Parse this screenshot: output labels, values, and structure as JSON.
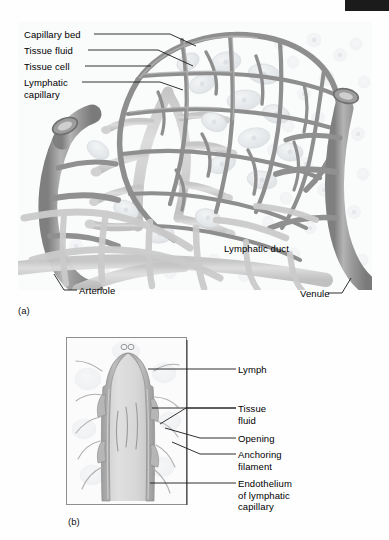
{
  "figure": {
    "panel_a": {
      "letter": "(a)",
      "labels": {
        "capillary_bed": "Capillary bed",
        "tissue_fluid": "Tissue fluid",
        "tissue_cell": "Tissue cell",
        "lymphatic_capillary": "Lymphatic\ncapillary",
        "lymphatic_duct": "Lymphatic duct",
        "arteriole": "Arteriole",
        "venule": "Venule"
      }
    },
    "panel_b": {
      "letter": "(b)",
      "labels": {
        "lymph": "Lymph",
        "tissue_fluid": "Tissue\nfluid",
        "opening": "Opening",
        "anchoring_filament": "Anchoring\nfilament",
        "endothelium": "Endothelium\nof lymphatic\ncapillary"
      }
    }
  },
  "colors": {
    "page_background": "#fefefe",
    "scan_bar": "#1b1b1b",
    "vessel_dark": "#8c8c8c",
    "vessel_mid": "#a6a6a6",
    "vessel_light": "#c2c2c2",
    "lymphatic_light": "#d4d4d4",
    "tissue_cell": "#e6e8ea",
    "background_tissue": "#f5f6f7",
    "label_text": "#000000",
    "leader_line": "#1a1a1a",
    "panel_border": "#8f8f8f"
  },
  "icons": {
    "scan_bar": "scan-artifact-bar"
  }
}
